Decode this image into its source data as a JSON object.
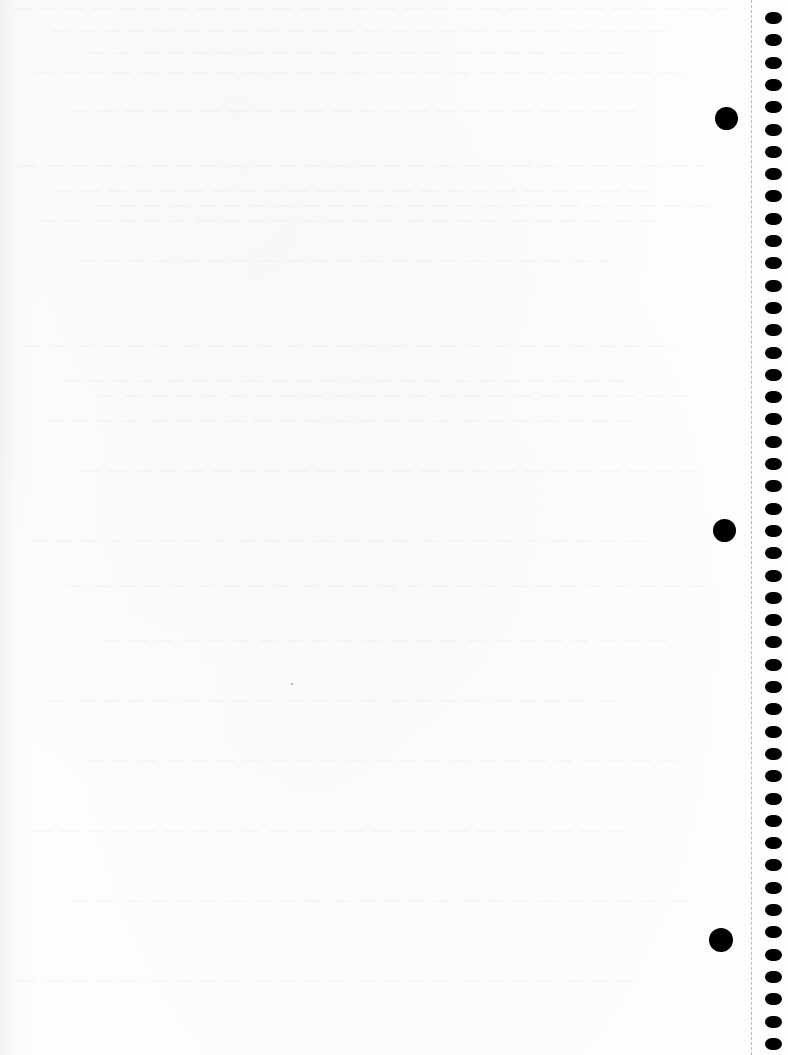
{
  "page": {
    "kind": "blank spiral notebook page (scanned)",
    "width": 788,
    "height": 1055,
    "background_color": "#fdfdfd",
    "text_content": ""
  },
  "perforation": {
    "x": 751,
    "color": "#b9b9b9",
    "style": "dashed"
  },
  "spiral_holes": {
    "x": 765,
    "first_y": 12,
    "pitch": 22.3,
    "count": 47,
    "width": 17,
    "height": 12,
    "color": "#000000"
  },
  "punch_holes": [
    {
      "cx": 726,
      "cy": 118,
      "diameter": 23,
      "color": "#000000"
    },
    {
      "cx": 724,
      "cy": 530,
      "diameter": 23,
      "color": "#000000"
    },
    {
      "cx": 721,
      "cy": 940,
      "diameter": 24,
      "color": "#000000"
    }
  ],
  "specks": [
    {
      "x": 291,
      "y": 683,
      "color": "#9a9a9a"
    }
  ]
}
